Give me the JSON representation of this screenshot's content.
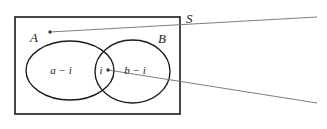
{
  "figure": {
    "kind": "venn-diagram",
    "background_color": "#ffffff",
    "stroke_color": "#1b1b1b",
    "callout_color": "#6e6e6e"
  },
  "labels": {
    "universe": "S",
    "set_a": "A",
    "set_b": "B",
    "region_left": "a − i",
    "region_middle": "i",
    "region_right": "b − i"
  },
  "geometry": {
    "rectangle": {
      "x": 15,
      "y": 17,
      "width": 165,
      "height": 97
    },
    "ellipse_a": {
      "cx": 70,
      "cy": 70.5,
      "rx": 44,
      "ry": 29.5
    },
    "ellipse_b": {
      "cx": 132.5,
      "cy": 71.5,
      "rx": 37.5,
      "ry": 31.5
    },
    "callout_top": {
      "x1": 50,
      "y1": 32,
      "x2": 317,
      "y2": 17
    },
    "callout_bottom": {
      "x1": 108,
      "y1": 70,
      "x2": 317,
      "y2": 103
    },
    "dot_a": {
      "cx": 50,
      "cy": 32,
      "r": 1.6
    },
    "dot_i": {
      "cx": 108,
      "cy": 70,
      "r": 1.6
    }
  },
  "label_positions": {
    "universe": {
      "x": 186,
      "y": 23
    },
    "set_a": {
      "x": 34,
      "y": 42
    },
    "set_b": {
      "x": 157,
      "y": 43
    },
    "region_left": {
      "x": 47,
      "y": 74
    },
    "region_middle": {
      "x": 99,
      "y": 74
    },
    "region_right": {
      "x": 121,
      "y": 74
    }
  }
}
